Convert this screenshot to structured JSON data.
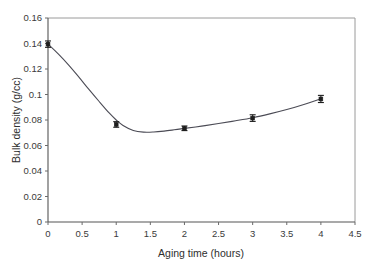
{
  "chart_data": {
    "type": "line",
    "title": "",
    "xlabel": "Aging time (hours)",
    "ylabel": "Bulk density (g/cc)",
    "xlim": [
      0,
      4.5
    ],
    "ylim": [
      0,
      0.16
    ],
    "grid": false,
    "legend": null,
    "xticks": [
      0,
      0.5,
      1,
      1.5,
      2,
      2.5,
      3,
      3.5,
      4,
      4.5
    ],
    "xtick_labels": [
      "0",
      "0.5",
      "1",
      "1.5",
      "2",
      "2.5",
      "3",
      "3.5",
      "4",
      "4.5"
    ],
    "yticks": [
      0,
      0.02,
      0.04,
      0.06,
      0.08,
      0.1,
      0.12,
      0.14,
      0.16
    ],
    "ytick_labels": [
      "0",
      "0.02",
      "0.04",
      "0.06",
      "0.08",
      "0.1",
      "0.12",
      "0.14",
      "0.16"
    ],
    "series": [
      {
        "name": "Bulk density",
        "x": [
          0,
          1,
          2,
          3,
          4
        ],
        "values": [
          0.1395,
          0.0765,
          0.0735,
          0.0815,
          0.0965
        ],
        "yerr": [
          0.0025,
          0.0022,
          0.0018,
          0.0026,
          0.0028
        ],
        "marker": "square",
        "line_style": "smooth-spline"
      }
    ],
    "curve_points": [
      [
        0.0,
        0.1395
      ],
      [
        0.15,
        0.1318
      ],
      [
        0.3,
        0.1232
      ],
      [
        0.45,
        0.1138
      ],
      [
        0.6,
        0.104
      ],
      [
        0.75,
        0.0945
      ],
      [
        0.9,
        0.0853
      ],
      [
        1.0,
        0.08
      ],
      [
        1.1,
        0.0757
      ],
      [
        1.25,
        0.0718
      ],
      [
        1.4,
        0.0705
      ],
      [
        1.55,
        0.0706
      ],
      [
        1.7,
        0.0713
      ],
      [
        1.85,
        0.0723
      ],
      [
        2.0,
        0.0734
      ],
      [
        2.25,
        0.0752
      ],
      [
        2.5,
        0.0772
      ],
      [
        2.75,
        0.0794
      ],
      [
        3.0,
        0.0818
      ],
      [
        3.25,
        0.0848
      ],
      [
        3.5,
        0.0882
      ],
      [
        3.75,
        0.0922
      ],
      [
        4.0,
        0.0967
      ]
    ],
    "colors": {
      "line": "#4b4b55",
      "marker": "#1e1e1e",
      "axis": "#555555",
      "frame": "#9a9a9a",
      "text": "#3a3a3a",
      "background": "#ffffff"
    }
  }
}
